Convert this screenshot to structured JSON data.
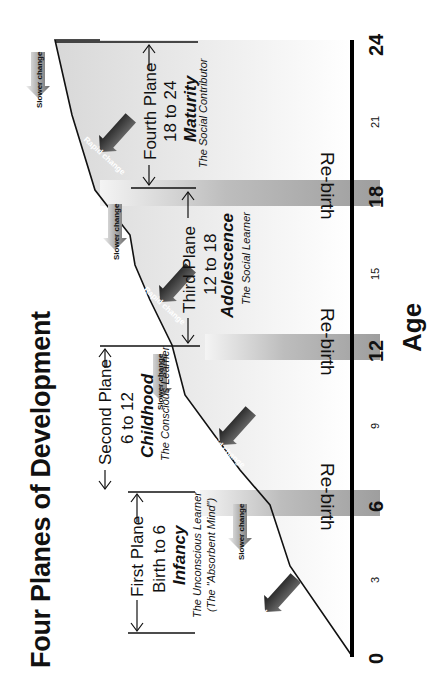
{
  "title": "Four Planes of Development",
  "axis": {
    "label": "Age",
    "ticks": [
      {
        "value": "0",
        "major": true
      },
      {
        "value": "3",
        "major": false
      },
      {
        "value": "6",
        "major": true
      },
      {
        "value": "9",
        "major": false
      },
      {
        "value": "12",
        "major": true
      },
      {
        "value": "15",
        "major": false
      },
      {
        "value": "18",
        "major": true
      },
      {
        "value": "21",
        "major": false
      },
      {
        "value": "24",
        "major": true
      }
    ]
  },
  "rebirth_label": "Re-birth",
  "planes": [
    {
      "heading": "First Plane",
      "range": "Birth to 6",
      "name": "Infancy",
      "subtitle": "The Unconscious Learner",
      "subtitle2": "(The \"Absorbent Mind\")"
    },
    {
      "heading": "Second Plane",
      "range": "6 to 12",
      "name": "Childhood",
      "subtitle": "The Conscious Learner"
    },
    {
      "heading": "Third Plane",
      "range": "12 to 18",
      "name": "Adolescence",
      "subtitle": "The Social Learner"
    },
    {
      "heading": "Fourth Plane",
      "range": "18 to 24",
      "name": "Maturity",
      "subtitle": "The Social Contributor"
    }
  ],
  "change_arrows": {
    "rapid": "Rapid change",
    "slower": "Slower change"
  },
  "colors": {
    "ink": "#111111",
    "band": "#a8a8a8",
    "fill": "#e4e4e4",
    "arrow_dark": "#3a3a3a",
    "arrow_light": "#bdbdbd"
  }
}
